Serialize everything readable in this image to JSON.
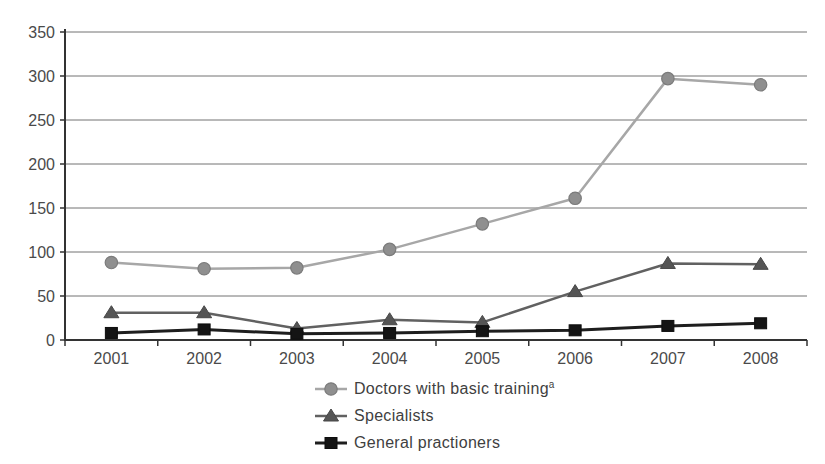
{
  "chart_data": {
    "type": "line",
    "title": "",
    "xlabel": "",
    "ylabel": "",
    "x": [
      "2001",
      "2002",
      "2003",
      "2004",
      "2005",
      "2006",
      "2007",
      "2008"
    ],
    "series": [
      {
        "id": "doctors-basic-training",
        "name": "Doctors with basic training",
        "name_superscript": "a",
        "marker": "circle",
        "values": [
          88,
          81,
          82,
          103,
          132,
          161,
          297,
          290
        ],
        "line_color": "#a7a7a7",
        "marker_fill": "#8f8f8f",
        "marker_stroke": "#7b7b7b",
        "line_width": 2.5
      },
      {
        "id": "specialists",
        "name": "Specialists",
        "name_superscript": "",
        "marker": "triangle",
        "values": [
          31,
          31,
          13,
          23,
          20,
          55,
          87,
          86
        ],
        "line_color": "#616161",
        "marker_fill": "#555555",
        "marker_stroke": "#474747",
        "line_width": 2.5
      },
      {
        "id": "general-practioners",
        "name": "General practioners",
        "name_superscript": "",
        "marker": "square",
        "values": [
          8,
          12,
          7,
          8,
          10,
          11,
          16,
          19
        ],
        "line_color": "#1e1e1e",
        "marker_fill": "#141414",
        "marker_stroke": "#0d0d0d",
        "line_width": 3
      }
    ],
    "ylim": [
      0,
      350
    ],
    "yticks": [
      0,
      50,
      100,
      150,
      200,
      250,
      300,
      350
    ],
    "grid": "horizontal",
    "legend_position": "bottom-center",
    "axis_color": "#333333",
    "grid_color": "#737373",
    "tick_label_color": "#4a4a4a",
    "background_color": "#ffffff"
  }
}
